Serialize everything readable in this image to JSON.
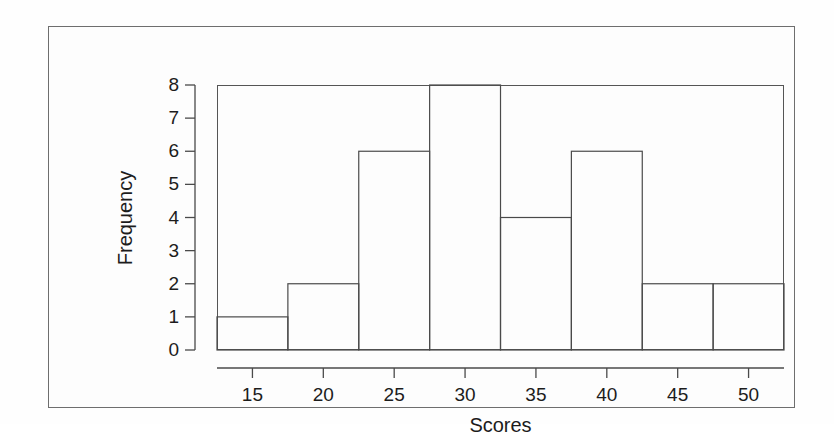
{
  "chart_data": {
    "type": "bar",
    "title": "",
    "xlabel": "Scores",
    "ylabel": "Frequency",
    "bin_edges": [
      12.5,
      17.5,
      22.5,
      27.5,
      32.5,
      37.5,
      42.5,
      47.5,
      52.5
    ],
    "bin_width": 5,
    "categories": [
      "12.5-17.5",
      "17.5-22.5",
      "22.5-27.5",
      "27.5-32.5",
      "32.5-37.5",
      "37.5-42.5",
      "42.5-47.5",
      "47.5-52.5"
    ],
    "values": [
      1,
      2,
      6,
      8,
      4,
      6,
      2,
      2
    ],
    "xlim": [
      12.5,
      52.5
    ],
    "ylim": [
      0,
      8
    ],
    "xticks": [
      15,
      20,
      25,
      30,
      35,
      40,
      45,
      50
    ],
    "xtick_labels": [
      "15",
      "20",
      "25",
      "30",
      "35",
      "40",
      "45",
      "50"
    ],
    "yticks": [
      0,
      1,
      2,
      3,
      4,
      5,
      6,
      7,
      8
    ],
    "ytick_labels": [
      "0",
      "1",
      "2",
      "3",
      "4",
      "5",
      "6",
      "7",
      "8"
    ],
    "grid": false,
    "legend": null,
    "series_name": "Frequency",
    "bar_fill": "none",
    "bar_stroke": "#4a4a4a",
    "background": "#fdfdfd"
  },
  "figure": {
    "border_color": "#6e6e6e",
    "plot_border_color": "#555555"
  }
}
